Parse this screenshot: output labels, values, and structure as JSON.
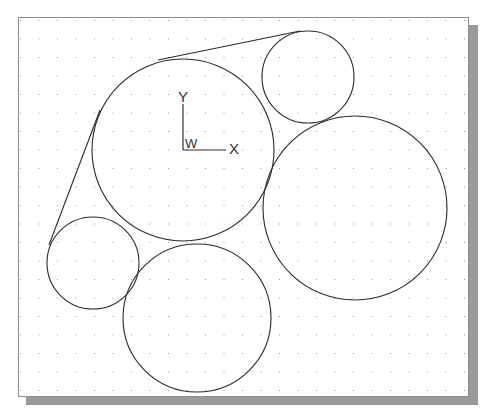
{
  "viewport": {
    "background": "#ffffff",
    "border_color": "#8c8c8c",
    "shadow_color": "#9a9a9a",
    "grid": {
      "spacing_px": 18.5,
      "dot_color": "#9a9a9a",
      "visible": true
    }
  },
  "ucs_icon": {
    "x_label": "X",
    "y_label": "Y",
    "w_label": "W"
  },
  "drawing": {
    "stroke_color": "#2b2b2b",
    "circles": [
      {
        "name": "large-center-circle",
        "cx": 183,
        "cy": 150,
        "r": 91
      },
      {
        "name": "small-top-right-circle",
        "cx": 308,
        "cy": 77,
        "r": 46
      },
      {
        "name": "large-right-circle",
        "cx": 355,
        "cy": 208,
        "r": 92
      },
      {
        "name": "small-left-circle",
        "cx": 93,
        "cy": 263,
        "r": 46
      },
      {
        "name": "bottom-circle",
        "cx": 197,
        "cy": 318,
        "r": 74
      }
    ],
    "lines": [
      {
        "name": "top-tangent-line",
        "x1": 158,
        "y1": 60,
        "x2": 300,
        "y2": 31
      },
      {
        "name": "left-tangent-line",
        "x1": 100,
        "y1": 110,
        "x2": 49,
        "y2": 245
      }
    ]
  }
}
